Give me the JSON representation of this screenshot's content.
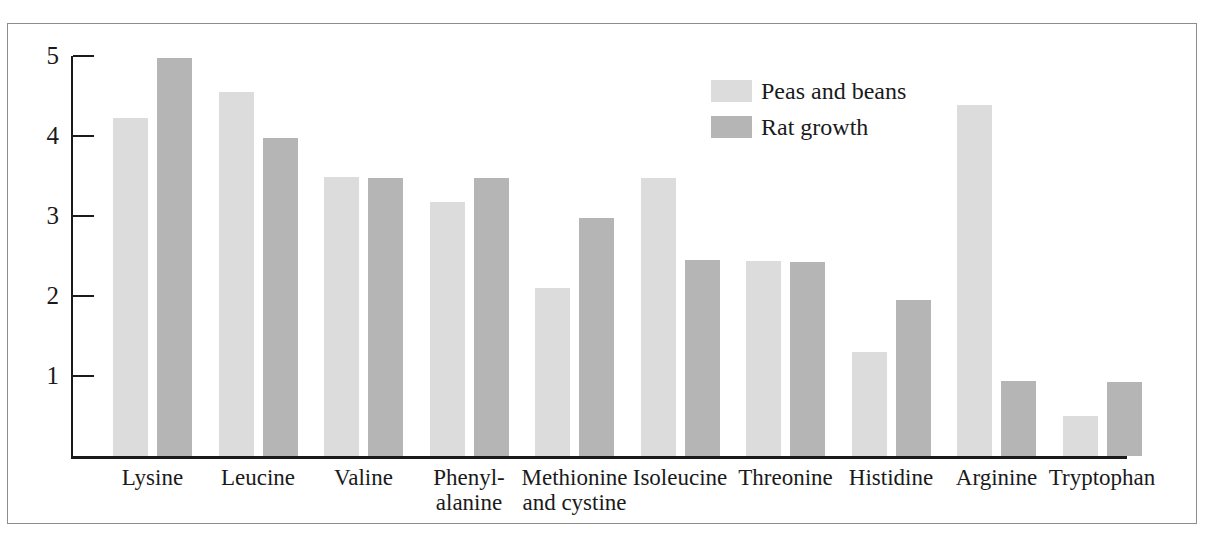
{
  "figure": {
    "cut_off_caption": "",
    "frame_color": "#8d8d8d",
    "background": "#ffffff"
  },
  "legend": {
    "position": "inside-top-center-right",
    "items": [
      {
        "label": "Peas and beans",
        "color": "#dcdcdc",
        "swatch": "light-gray-swatch"
      },
      {
        "label": "Rat growth",
        "color": "#b5b5b5",
        "swatch": "dark-gray-swatch"
      }
    ]
  },
  "axes": {
    "y_ticks": [
      "1",
      "2",
      "3",
      "4",
      "5"
    ],
    "y_tick_values": [
      1,
      2,
      3,
      4,
      5
    ],
    "ylabel": "",
    "xlabel": "",
    "ylim": [
      0,
      5.3
    ],
    "grid": false
  },
  "chart_data": {
    "type": "bar",
    "title": "",
    "subtitle": "",
    "xlabel": "",
    "ylabel": "",
    "ylim": [
      0,
      5.3
    ],
    "grid": false,
    "legend_position": "upper-center-right",
    "categories": [
      "Lysine",
      "Leucine",
      "Valine",
      "Phenyl-\nalanine",
      "Methionine\nand cystine",
      "Isoleucine",
      "Threonine",
      "Histidine",
      "Arginine",
      "Tryptophan"
    ],
    "series": [
      {
        "name": "Peas and beans",
        "color": "#dcdcdc",
        "values": [
          4.22,
          4.55,
          3.49,
          3.18,
          2.1,
          3.48,
          2.44,
          1.3,
          4.39,
          0.5
        ]
      },
      {
        "name": "Rat growth",
        "color": "#b5b5b5",
        "values": [
          4.97,
          3.98,
          3.47,
          3.47,
          2.97,
          2.45,
          2.43,
          1.95,
          0.94,
          0.93
        ]
      }
    ]
  }
}
